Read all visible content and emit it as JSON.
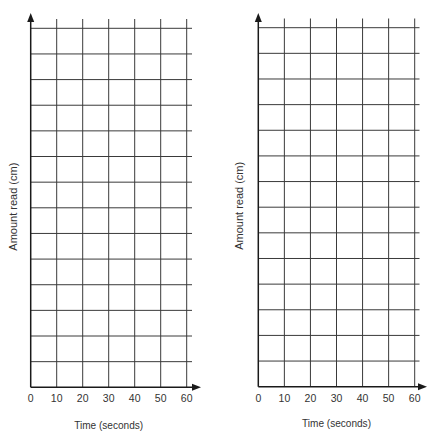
{
  "chart_data": [
    {
      "type": "line",
      "title": "",
      "xlabel": "Time (seconds)",
      "ylabel": "Amount read (cm)",
      "x_ticks": [
        "0",
        "10",
        "20",
        "30",
        "40",
        "50",
        "60"
      ],
      "y_ticks": [],
      "xlim": [
        0,
        60
      ],
      "grid": true,
      "grid_columns": 6,
      "grid_rows": 14,
      "series": [],
      "legend": null
    },
    {
      "type": "line",
      "title": "",
      "xlabel": "Time (seconds)",
      "ylabel": "Amount read (cm)",
      "x_ticks": [
        "0",
        "10",
        "20",
        "30",
        "40",
        "50",
        "60"
      ],
      "y_ticks": [],
      "xlim": [
        0,
        60
      ],
      "grid": true,
      "grid_columns": 6,
      "grid_rows": 14,
      "series": [],
      "legend": null
    }
  ],
  "charts": [
    {
      "id": "left",
      "xlabel": "Time (seconds)",
      "ylabel": "Amount read (cm)",
      "x_ticks": [
        "0",
        "10",
        "20",
        "30",
        "40",
        "50",
        "60"
      ]
    },
    {
      "id": "right",
      "xlabel": "Time (seconds)",
      "ylabel": "Amount read (cm)",
      "x_ticks": [
        "0",
        "10",
        "20",
        "30",
        "40",
        "50",
        "60"
      ]
    }
  ],
  "style": {
    "grid_color": "#3a3a3a",
    "axis_color": "#1a1a1a",
    "text_color": "#333333"
  }
}
